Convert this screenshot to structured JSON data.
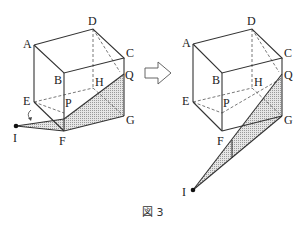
{
  "figure": {
    "caption": "図 3",
    "arrow": "right-arrow",
    "left": {
      "labels": {
        "A": "A",
        "B": "B",
        "C": "C",
        "D": "D",
        "E": "E",
        "F": "F",
        "G": "G",
        "H": "H",
        "P": "P",
        "Q": "Q",
        "I": "I"
      },
      "vertices": {
        "A": [
          34,
          45
        ],
        "B": [
          64,
          73
        ],
        "C": [
          124,
          58
        ],
        "D": [
          93,
          29
        ],
        "E": [
          34,
          102
        ],
        "F": [
          64,
          131
        ],
        "G": [
          124,
          116
        ],
        "H": [
          93,
          88
        ],
        "P": [
          64,
          110
        ],
        "Q": [
          124,
          74
        ],
        "I": [
          16,
          126
        ]
      },
      "shaded_region": "I-P-Q-G-F"
    },
    "right": {
      "labels": {
        "A": "A",
        "B": "B",
        "C": "C",
        "D": "D",
        "E": "E",
        "F": "F",
        "G": "G",
        "H": "H",
        "P": "P",
        "Q": "Q",
        "I": "I"
      },
      "vertices": {
        "A": [
          193,
          44
        ],
        "B": [
          222,
          73
        ],
        "C": [
          282,
          58
        ],
        "D": [
          252,
          29
        ],
        "E": [
          193,
          102
        ],
        "F": [
          222,
          131
        ],
        "G": [
          282,
          116
        ],
        "H": [
          252,
          88
        ],
        "P": [
          222,
          110
        ],
        "Q": [
          282,
          74
        ],
        "I": [
          193,
          190
        ]
      },
      "shaded_region": "I-Q-G"
    },
    "colors": {
      "line": "#333333",
      "shade": "#bdbdbd",
      "background": "#ffffff"
    }
  }
}
